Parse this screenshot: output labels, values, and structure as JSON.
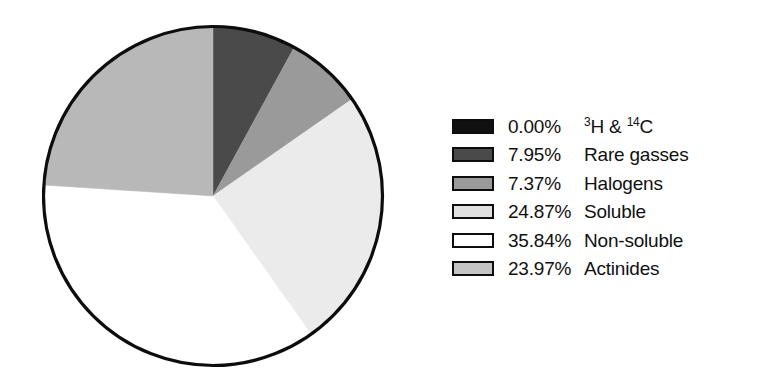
{
  "chart_data": {
    "type": "pie",
    "title": "",
    "subtitle": "",
    "xlabel": "",
    "ylabel": "",
    "grid": false,
    "legend_position": "right",
    "start_angle_deg": 0,
    "direction": "clockwise",
    "center": {
      "x": 213,
      "y": 196
    },
    "radius": 171,
    "outline_color": "#0d0d0d",
    "categories": [
      "3H & 14C",
      "Rare gasses",
      "Halogens",
      "Soluble",
      "Non-soluble",
      "Actinides"
    ],
    "values": [
      0.0,
      7.95,
      7.37,
      24.87,
      35.84,
      23.97
    ],
    "labels": [
      "0.00%",
      "7.95%",
      "7.37%",
      "24.87%",
      "35.84%",
      "23.97%"
    ],
    "colors": [
      "#111111",
      "#4a4a4a",
      "#9a9a9a",
      "#ebebeb",
      "#ffffff",
      "#b8b8b8"
    ],
    "slices": [
      {
        "label": "3H & 14C",
        "value": 0.0,
        "percent": "0.00%",
        "color": "#111111",
        "start_deg": 0.0,
        "end_deg": 0.0
      },
      {
        "label": "Rare gasses",
        "value": 7.95,
        "percent": "7.95%",
        "color": "#4a4a4a",
        "start_deg": 0.0,
        "end_deg": 28.62
      },
      {
        "label": "Halogens",
        "value": 7.37,
        "percent": "7.37%",
        "color": "#9a9a9a",
        "start_deg": 28.62,
        "end_deg": 55.15
      },
      {
        "label": "Soluble",
        "value": 24.87,
        "percent": "24.87%",
        "color": "#ebebeb",
        "start_deg": 55.15,
        "end_deg": 144.68
      },
      {
        "label": "Non-soluble",
        "value": 35.84,
        "percent": "35.84%",
        "color": "#ffffff",
        "start_deg": 144.68,
        "end_deg": 273.7
      },
      {
        "label": "Actinides",
        "value": 23.97,
        "percent": "23.97%",
        "color": "#b8b8b8",
        "start_deg": 273.7,
        "end_deg": 360.0
      }
    ]
  },
  "legend": {
    "items": [
      {
        "swatch_color": "#111111",
        "percent": "0.00%",
        "label_prefix": "",
        "sup1": "3",
        "mid": "H & ",
        "sup2": "14",
        "suffix": "C",
        "label_plain": "3H & 14C",
        "has_superscripts": true
      },
      {
        "swatch_color": "#4a4a4a",
        "percent": "7.95%",
        "label_plain": "Rare gasses",
        "has_superscripts": false
      },
      {
        "swatch_color": "#9a9a9a",
        "percent": "7.37%",
        "label_plain": "Halogens",
        "has_superscripts": false
      },
      {
        "swatch_color": "#e0e0e0",
        "percent": "24.87%",
        "label_plain": "Soluble",
        "has_superscripts": false
      },
      {
        "swatch_color": "#ffffff",
        "percent": "35.84%",
        "label_plain": "Non-soluble",
        "has_superscripts": false
      },
      {
        "swatch_color": "#c4c4c4",
        "percent": "23.97%",
        "label_plain": "Actinides",
        "has_superscripts": false
      }
    ]
  }
}
